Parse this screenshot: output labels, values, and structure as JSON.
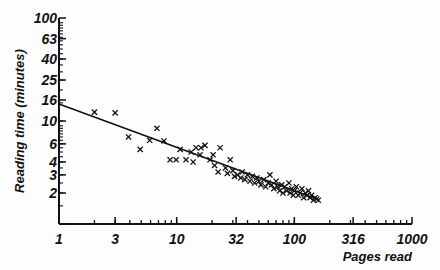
{
  "chart_data": {
    "type": "scatter",
    "title": "",
    "xlabel": "Pages read",
    "ylabel": "Reading time (minutes)",
    "xscale": "log",
    "yscale": "log",
    "xlim": [
      1,
      1000
    ],
    "ylim": [
      1,
      100
    ],
    "x_ticks": [
      1,
      3,
      10,
      32,
      100,
      316,
      1000
    ],
    "x_tick_labels": [
      "1",
      "3",
      "10",
      "32",
      "100",
      "316",
      "1000"
    ],
    "y_ticks": [
      1,
      2,
      3,
      4,
      6,
      10,
      16,
      25,
      40,
      63,
      100
    ],
    "y_tick_labels": [
      "1",
      "2",
      "3",
      "4",
      "6",
      "10",
      "16",
      "25",
      "40",
      "63",
      "100"
    ],
    "grid": false,
    "legend": null,
    "marker": "x",
    "fit_line": {
      "type": "power",
      "a": 14.6,
      "b": -0.42,
      "x_range": [
        1,
        160
      ],
      "description": "y = 14.6 * x^-0.42 (linear on log-log axes)"
    },
    "points": [
      [
        2.0,
        12.2
      ],
      [
        3.0,
        12.0
      ],
      [
        3.9,
        7.0
      ],
      [
        4.9,
        5.3
      ],
      [
        5.9,
        6.5
      ],
      [
        6.8,
        8.5
      ],
      [
        7.8,
        6.4
      ],
      [
        8.8,
        4.2
      ],
      [
        9.9,
        4.2
      ],
      [
        10.7,
        5.3
      ],
      [
        12.0,
        4.2
      ],
      [
        13.3,
        5.0
      ],
      [
        13.8,
        4.0
      ],
      [
        14.6,
        5.5
      ],
      [
        15.8,
        4.7
      ],
      [
        16.1,
        5.5
      ],
      [
        17.4,
        5.8
      ],
      [
        19.2,
        4.2
      ],
      [
        20.4,
        4.7
      ],
      [
        21.0,
        3.7
      ],
      [
        22.5,
        3.2
      ],
      [
        23.4,
        5.5
      ],
      [
        26.0,
        3.5
      ],
      [
        28.5,
        4.2
      ],
      [
        27.0,
        3.1
      ],
      [
        30.0,
        3.3
      ],
      [
        31.0,
        2.9
      ],
      [
        33.0,
        3.0
      ],
      [
        35.0,
        2.8
      ],
      [
        36.0,
        3.2
      ],
      [
        38.0,
        2.7
      ],
      [
        40.0,
        3.0
      ],
      [
        42.0,
        2.6
      ],
      [
        44.0,
        2.9
      ],
      [
        46.0,
        2.5
      ],
      [
        48.0,
        2.8
      ],
      [
        50.0,
        2.6
      ],
      [
        52.0,
        2.4
      ],
      [
        55.0,
        2.7
      ],
      [
        57.0,
        2.3
      ],
      [
        60.0,
        2.5
      ],
      [
        62.0,
        3.0
      ],
      [
        64.0,
        2.4
      ],
      [
        67.0,
        2.2
      ],
      [
        70.0,
        2.6
      ],
      [
        72.0,
        2.3
      ],
      [
        75.0,
        2.1
      ],
      [
        78.0,
        2.4
      ],
      [
        80.0,
        2.0
      ],
      [
        83.0,
        2.3
      ],
      [
        86.0,
        2.1
      ],
      [
        90.0,
        2.5
      ],
      [
        92.0,
        2.0
      ],
      [
        95.0,
        2.2
      ],
      [
        98.0,
        1.9
      ],
      [
        100.0,
        2.1
      ],
      [
        104.0,
        2.3
      ],
      [
        108.0,
        1.9
      ],
      [
        112.0,
        2.0
      ],
      [
        116.0,
        2.2
      ],
      [
        120.0,
        1.8
      ],
      [
        124.0,
        2.0
      ],
      [
        128.0,
        1.9
      ],
      [
        132.0,
        2.1
      ],
      [
        136.0,
        1.8
      ],
      [
        140.0,
        1.9
      ],
      [
        145.0,
        1.7
      ],
      [
        150.0,
        1.8
      ],
      [
        155.0,
        1.75
      ],
      [
        160.0,
        1.7
      ]
    ]
  },
  "colors": {
    "background": "#fdfdfd",
    "ink": "#111111"
  }
}
